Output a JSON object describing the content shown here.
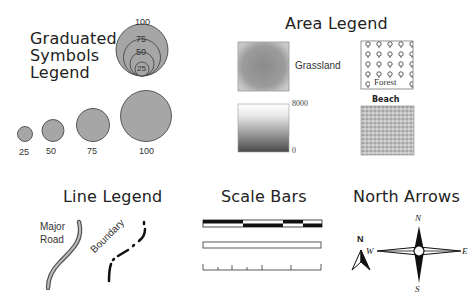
{
  "graduated": {
    "title_lines": [
      "Graduated",
      "Symbols",
      "Legend"
    ],
    "nested_labels": [
      "100",
      "75",
      "50",
      "25"
    ],
    "circle_labels": [
      "25",
      "50",
      "75",
      "100"
    ]
  },
  "area": {
    "title": "Area Legend",
    "grassland_label": "Grassland",
    "gradient_max": "8000",
    "gradient_min": "0",
    "forest_label": "Forest",
    "beach_label": "Beach"
  },
  "line": {
    "title": "Line Legend",
    "road_label_lines": [
      "Major",
      "Road"
    ],
    "boundary_label": "Boundary"
  },
  "scale": {
    "title": "Scale Bars"
  },
  "north": {
    "title": "North Arrows",
    "simple_label": "N",
    "compass": {
      "n": "N",
      "s": "S",
      "e": "E",
      "w": "W"
    }
  },
  "colors": {
    "symbol_fill": "#a6a6a6",
    "symbol_stroke": "#3a3a3a",
    "ink": "#111111"
  }
}
